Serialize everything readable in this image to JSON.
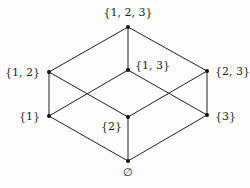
{
  "diagram": {
    "type": "hasse-diagram",
    "nodes": [
      {
        "id": "n123",
        "label": "{1, 2, 3}",
        "x": 128,
        "y": 27,
        "lx": 128,
        "ly": 16,
        "anchor": "middle"
      },
      {
        "id": "n12",
        "label": "{1, 2}",
        "x": 49,
        "y": 72,
        "lx": 40,
        "ly": 76,
        "anchor": "end"
      },
      {
        "id": "n13",
        "label": "{1, 3}",
        "x": 128,
        "y": 70,
        "lx": 135,
        "ly": 69,
        "anchor": "start"
      },
      {
        "id": "n23",
        "label": "{2, 3}",
        "x": 207,
        "y": 71,
        "lx": 215,
        "ly": 75,
        "anchor": "start"
      },
      {
        "id": "n1",
        "label": "{1}",
        "x": 49,
        "y": 116,
        "lx": 40,
        "ly": 120,
        "anchor": "end"
      },
      {
        "id": "n2",
        "label": "{2}",
        "x": 128,
        "y": 117,
        "lx": 122,
        "ly": 130,
        "anchor": "end"
      },
      {
        "id": "n3",
        "label": "{3}",
        "x": 207,
        "y": 115,
        "lx": 215,
        "ly": 120,
        "anchor": "start"
      },
      {
        "id": "n0",
        "label": "∅",
        "x": 128,
        "y": 161,
        "lx": 128,
        "ly": 176,
        "anchor": "middle"
      }
    ],
    "edges": [
      [
        "n123",
        "n12"
      ],
      [
        "n123",
        "n13"
      ],
      [
        "n123",
        "n23"
      ],
      [
        "n12",
        "n1"
      ],
      [
        "n12",
        "n2"
      ],
      [
        "n13",
        "n1"
      ],
      [
        "n13",
        "n3"
      ],
      [
        "n23",
        "n2"
      ],
      [
        "n23",
        "n3"
      ],
      [
        "n1",
        "n0"
      ],
      [
        "n2",
        "n0"
      ],
      [
        "n3",
        "n0"
      ]
    ],
    "colors": {
      "line": "#222222",
      "node": "#111111",
      "label": "#222222"
    }
  }
}
